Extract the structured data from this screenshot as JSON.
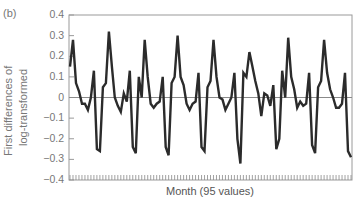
{
  "chart_data": {
    "type": "line",
    "panel_label": "(b)",
    "title": "",
    "xlabel": "Month (95 values)",
    "ylabel_lines": [
      "First differences of",
      "log-transformed"
    ],
    "ylim": [
      -0.4,
      0.4
    ],
    "yticks": [
      0.4,
      0.3,
      0.2,
      0.1,
      0,
      -0.1,
      -0.2,
      -0.3,
      -0.4
    ],
    "ytick_labels": [
      "0.4",
      "0.3",
      "0.2",
      "0.1",
      "0",
      "−0.1",
      "−0.2",
      "−0.3",
      "−0.4"
    ],
    "xticks_count": 95,
    "grid": false,
    "zero_line": true,
    "line_color": "#2b2b2b",
    "series": [
      {
        "name": "First differences of log-transformed",
        "values": [
          0.15,
          0.28,
          0.07,
          0.03,
          -0.03,
          -0.03,
          -0.06,
          0.0,
          0.13,
          -0.25,
          -0.26,
          0.05,
          0.07,
          0.32,
          0.15,
          0.0,
          -0.04,
          -0.07,
          0.02,
          -0.02,
          0.13,
          -0.24,
          -0.27,
          0.1,
          0.0,
          0.28,
          0.1,
          -0.03,
          -0.05,
          -0.03,
          -0.02,
          0.1,
          -0.24,
          -0.28,
          0.07,
          0.1,
          0.3,
          0.1,
          0.06,
          -0.03,
          -0.06,
          -0.03,
          -0.02,
          0.12,
          -0.24,
          -0.26,
          0.05,
          0.08,
          0.28,
          0.1,
          0.0,
          -0.01,
          -0.06,
          -0.03,
          0.0,
          0.12,
          -0.2,
          -0.32,
          0.12,
          0.1,
          0.22,
          0.15,
          0.08,
          0.02,
          -0.09,
          0.02,
          0.01,
          -0.04,
          0.06,
          -0.25,
          -0.2,
          0.13,
          0.0,
          0.29,
          0.1,
          0.04,
          -0.05,
          -0.02,
          -0.04,
          -0.03,
          0.12,
          -0.23,
          -0.27,
          0.05,
          0.08,
          0.28,
          0.12,
          0.04,
          0.0,
          -0.05,
          -0.05,
          -0.03,
          0.12,
          -0.26,
          -0.29
        ]
      }
    ]
  }
}
